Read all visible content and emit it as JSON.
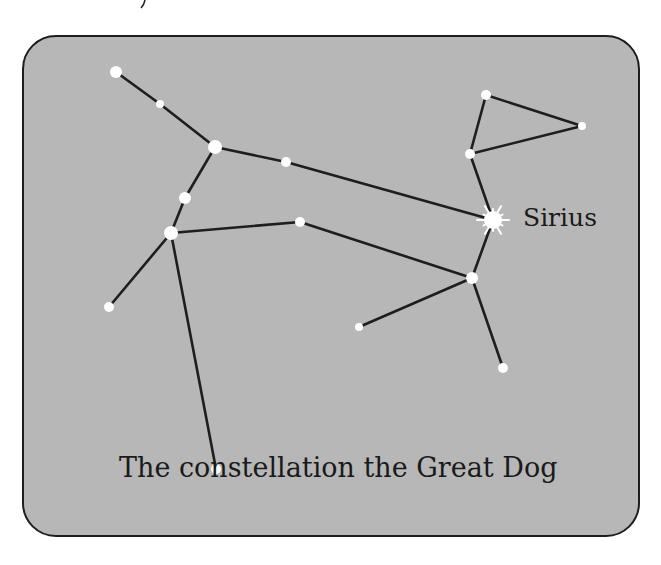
{
  "illustration": {
    "title": "The constellation the Great Dog",
    "background_color": "#b7b7b7",
    "line_color": "#1e1e1e",
    "star_color": "#ffffff"
  },
  "labels": {
    "star_name": "Sirius",
    "caption": "The constellation the Great Dog"
  },
  "stars": [
    {
      "id": "A",
      "x": 116,
      "y": 72,
      "r": 6
    },
    {
      "id": "B",
      "x": 160,
      "y": 104,
      "r": 4
    },
    {
      "id": "C",
      "x": 215,
      "y": 147,
      "r": 7
    },
    {
      "id": "D",
      "x": 286,
      "y": 162,
      "r": 5
    },
    {
      "id": "E",
      "name": "Sirius",
      "x": 493,
      "y": 220,
      "r": 9,
      "bright": true
    },
    {
      "id": "F",
      "x": 185,
      "y": 198,
      "r": 6
    },
    {
      "id": "G",
      "x": 171,
      "y": 233,
      "r": 7
    },
    {
      "id": "H",
      "x": 300,
      "y": 222,
      "r": 5
    },
    {
      "id": "I",
      "x": 109,
      "y": 307,
      "r": 5
    },
    {
      "id": "J",
      "x": 216,
      "y": 469,
      "r": 5
    },
    {
      "id": "K",
      "x": 472,
      "y": 278,
      "r": 6
    },
    {
      "id": "L",
      "x": 359,
      "y": 327,
      "r": 4
    },
    {
      "id": "M",
      "x": 503,
      "y": 368,
      "r": 5
    },
    {
      "id": "N",
      "x": 470,
      "y": 154,
      "r": 5
    },
    {
      "id": "O",
      "x": 486,
      "y": 95,
      "r": 5
    },
    {
      "id": "P",
      "x": 582,
      "y": 126,
      "r": 4
    }
  ],
  "connections": [
    [
      "A",
      "B"
    ],
    [
      "B",
      "C"
    ],
    [
      "C",
      "D"
    ],
    [
      "D",
      "E"
    ],
    [
      "C",
      "F"
    ],
    [
      "F",
      "G"
    ],
    [
      "G",
      "I"
    ],
    [
      "G",
      "J"
    ],
    [
      "G",
      "H"
    ],
    [
      "H",
      "K"
    ],
    [
      "E",
      "K"
    ],
    [
      "K",
      "L"
    ],
    [
      "K",
      "M"
    ],
    [
      "E",
      "N"
    ],
    [
      "N",
      "O"
    ],
    [
      "O",
      "P"
    ],
    [
      "P",
      "N"
    ]
  ]
}
